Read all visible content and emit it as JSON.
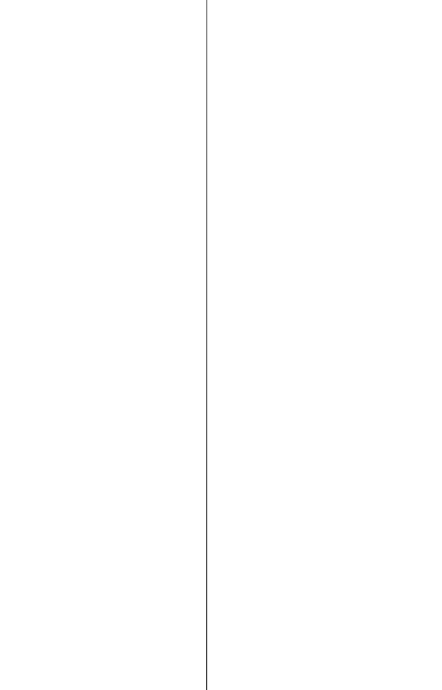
{
  "layout": {
    "type": "split-pane",
    "divider_x": 206,
    "background_color": "#ffffff",
    "divider_color_top": "#8a8a8a",
    "divider_color_bottom": "#3a3a3a"
  },
  "panes": {
    "left": {},
    "right": {}
  }
}
